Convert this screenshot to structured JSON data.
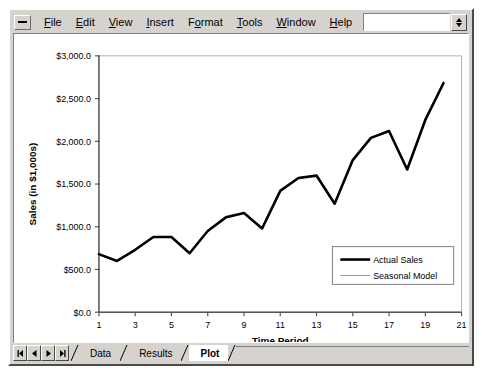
{
  "window": {
    "sysmenu_icon": "window-menu-icon",
    "spinner_icon": "updown-spinner-icon"
  },
  "menubar": {
    "items": [
      {
        "label": "File",
        "accel": "F"
      },
      {
        "label": "Edit",
        "accel": "E"
      },
      {
        "label": "View",
        "accel": "V"
      },
      {
        "label": "Insert",
        "accel": "I"
      },
      {
        "label": "Format",
        "accel": "o"
      },
      {
        "label": "Tools",
        "accel": "T"
      },
      {
        "label": "Window",
        "accel": "W"
      },
      {
        "label": "Help",
        "accel": "H"
      }
    ]
  },
  "tabstrip": {
    "nav_buttons": [
      {
        "name": "first-record-button",
        "icon": "first-arrow-icon"
      },
      {
        "name": "previous-record-button",
        "icon": "left-arrow-icon"
      },
      {
        "name": "next-record-button",
        "icon": "right-arrow-icon"
      },
      {
        "name": "last-record-button",
        "icon": "last-arrow-icon"
      }
    ],
    "tabs": [
      {
        "label": "Data",
        "active": false
      },
      {
        "label": "Results",
        "active": false
      },
      {
        "label": "Plot",
        "active": true
      }
    ]
  },
  "chart_data": {
    "type": "line",
    "title": "",
    "xlabel": "Time Period",
    "ylabel": "Sales (in $1,000s)",
    "x": [
      1,
      2,
      3,
      4,
      5,
      6,
      7,
      8,
      9,
      10,
      11,
      12,
      13,
      14,
      15,
      16,
      17,
      18,
      19,
      20
    ],
    "xlim": [
      1,
      21
    ],
    "ylim": [
      0,
      3000
    ],
    "xticks": [
      1,
      3,
      5,
      7,
      9,
      11,
      13,
      15,
      17,
      19,
      21
    ],
    "xticklabels": [
      "1",
      "3",
      "5",
      "7",
      "9",
      "11",
      "13",
      "15",
      "17",
      "19",
      "21"
    ],
    "yticks": [
      0,
      500,
      1000,
      1500,
      2000,
      2500,
      3000
    ],
    "yticklabels": [
      "$0.0",
      "$500.0",
      "$1,000.0",
      "$1,500.0",
      "$2,000.0",
      "$2,500.0",
      "$3,000.0"
    ],
    "grid": false,
    "legend_position": "lower right",
    "series": [
      {
        "name": "Actual Sales",
        "color": "#000000",
        "width": 2.6,
        "values": [
          680,
          600,
          730,
          880,
          880,
          690,
          950,
          1110,
          1160,
          980,
          1420,
          1570,
          1600,
          1270,
          1780,
          2040,
          2120,
          1670,
          2250,
          2680
        ]
      },
      {
        "name": "Seasonal Model",
        "color": "#999999",
        "width": 1.0,
        "values": [
          670,
          595,
          725,
          875,
          875,
          685,
          945,
          1100,
          1155,
          990,
          1415,
          1560,
          1585,
          1265,
          1775,
          2035,
          2110,
          1685,
          2245,
          2700
        ]
      }
    ]
  }
}
